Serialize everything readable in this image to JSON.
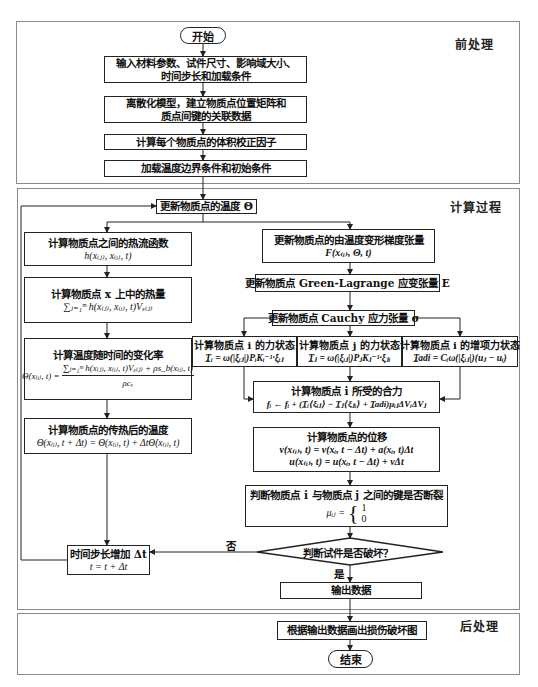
{
  "sections": {
    "pre": "前处理",
    "compute": "计算过程",
    "post": "后处理"
  },
  "nodes": {
    "start": "开始",
    "input": {
      "line1": "输入材料参数、试件尺寸、影响域大小、",
      "line2": "时间步长和加载条件"
    },
    "discretize": {
      "line1": "离散化模型，建立物质点位置矩阵和",
      "line2": "质点间键的关联数据"
    },
    "volume_correction": "计算每个物质点的体积校正因子",
    "load_bc": "加载温度边界条件和初始条件",
    "update_temperature": "更新物质点的温度 Θ",
    "heat_flow": {
      "title": "计算物质点之间的热流函数",
      "formula": "h(x₍ⱼ₎, x₍ᵢ₎, t)"
    },
    "heat_quantity": {
      "title": "计算物质点 x 上中的热量",
      "formula": "∑ⱼ₌₁ᵐ h(x₍ⱼ₎, x₍ᵢ₎, t)Vₓ₍ⱼ₎"
    },
    "temperature_rate": {
      "title": "计算温度随时间的变化率",
      "lhs": "Θ̇(x₍ᵢ₎, t) =",
      "numerator": "∑ⱼ₌₁ᵐ h(x₍ⱼ₎, x₍ᵢ₎, t)Vₓ₍ⱼ₎ + ρs_b(x₍ᵢ₎, t)",
      "denominator": "ρcᵥ"
    },
    "post_heat_temperature": {
      "title": "计算物质点的传热后的温度",
      "formula": "Θ(x₍ᵢ₎, t + Δt) = Θ(x₍ᵢ₎, t) + ΔtΘ̇(x₍ᵢ₎, t)"
    },
    "time_step": {
      "line1": "时间步长增加 Δt",
      "line2": "t = t + Δt"
    },
    "deformation_gradient": {
      "title": "更新物质点的由温度变形梯度张量",
      "formula": "F(x₍ᵢ₎, Θ, t)"
    },
    "green_lagrange": "更新物质点 Green-Lagrange 应变张量 E",
    "cauchy": "更新物质点 Cauchy 应力张量 σ",
    "force_state_i": {
      "title": "计算物质点 i 的力状态",
      "formula": "T̲ᵢ = ω(|ξᵢⱼ|)PᵢKᵢ⁻¹·ξᵢⱼ"
    },
    "force_state_j": {
      "title": "计算物质点 j 的力状态",
      "formula": "T̲ⱼ = ω(|ξᵢⱼ|)PⱼKⱼ⁻¹·ξⱼᵢ"
    },
    "force_state_adi": {
      "title": "计算物质点 i 的增项力状态",
      "formula": "T̲adi = Cᵢω(|ξᵢⱼ|)(uⱼ − uᵢ)"
    },
    "resultant_force": {
      "title": "计算物质点 i 所受的合力",
      "formula": "fᵢ ← fᵢ + (T̲ᵢ⟨ξᵢⱼ⟩ − T̲ⱼ⟨ξⱼᵢ⟩ + T̲adi)μᵢⱼΔVᵢΔVⱼ"
    },
    "displacement": {
      "title": "计算物质点的位移",
      "formula1": "v(x₍ᵢ₎, t) = v(xᵢ, t − Δt) + a(xᵢ, t)Δt",
      "formula2": "u(x₍ᵢ₎, t) = u(xᵢ, t − Δt) + vΔt"
    },
    "bond_break": {
      "title": "判断物质点 i 与物质点 j 之间的键是否断裂",
      "lhs": "μᵢⱼ =",
      "case1": "1",
      "case0": "0"
    },
    "decision": {
      "text": "判断试件是否破坏？",
      "yes": "是",
      "no": "否"
    },
    "output": "输出数据",
    "damage_plot": "根据输出数据画出损伤破坏图",
    "end": "结束"
  }
}
